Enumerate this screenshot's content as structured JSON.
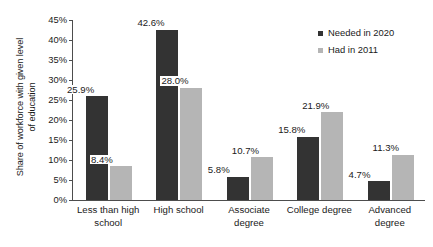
{
  "chart_data": {
    "type": "bar",
    "title": "",
    "subtitle": "",
    "xlabel": "",
    "ylabel": "Share of workforce with given level of education",
    "ylabel_lines": [
      "Share of workforce with given level",
      "of education"
    ],
    "categories": [
      "Less than high school",
      "High school",
      "Associate degree",
      "College degree",
      "Advanced degree"
    ],
    "category_lines": [
      [
        "Less than high",
        "school"
      ],
      [
        "High school"
      ],
      [
        "Associate",
        "degree"
      ],
      [
        "College degree"
      ],
      [
        "Advanced",
        "degree"
      ]
    ],
    "series": [
      {
        "name": "Needed in 2020",
        "color": "#333333",
        "values": [
          25.9,
          42.6,
          5.8,
          15.8,
          4.7
        ],
        "labels": [
          "25.9%",
          "42.6%",
          "5.8%",
          "15.8%",
          "4.7%"
        ]
      },
      {
        "name": "Had in 2011",
        "color": "#b5b5b5",
        "values": [
          8.4,
          28.0,
          10.7,
          21.9,
          11.3
        ],
        "labels": [
          "8.4%",
          "28.0%",
          "10.7%",
          "21.9%",
          "11.3%"
        ]
      }
    ],
    "ylim": [
      0,
      45
    ],
    "ytick_values": [
      0,
      5,
      10,
      15,
      20,
      25,
      30,
      35,
      40,
      45
    ],
    "ytick_labels": [
      "0%",
      "5%",
      "10%",
      "15%",
      "20%",
      "25%",
      "30%",
      "35%",
      "40%",
      "45%"
    ],
    "grid": false,
    "legend_position": "top-right",
    "value_labels_shown": true
  },
  "legend": {
    "items": [
      {
        "label": "Needed in 2020",
        "color": "#333333"
      },
      {
        "label": "Had in 2011",
        "color": "#b5b5b5"
      }
    ]
  }
}
